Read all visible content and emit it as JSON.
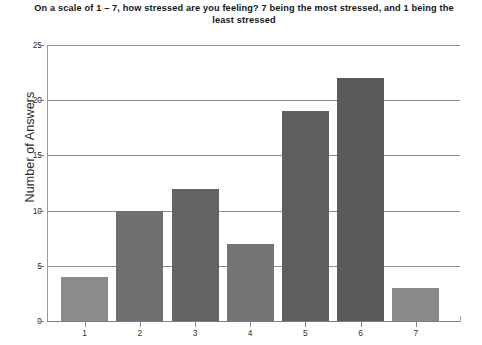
{
  "chart_data": {
    "type": "bar",
    "title": "On a scale of 1 – 7, how stressed are you feeling? 7 being the most stressed, and 1 being the least stressed",
    "xlabel": "",
    "ylabel": "Number of Answers",
    "categories": [
      "1",
      "2",
      "3",
      "4",
      "5",
      "6",
      "7"
    ],
    "values": [
      4,
      10,
      12,
      7,
      19,
      22,
      3
    ],
    "ylim": [
      0,
      25
    ],
    "ytick_labels": [
      "0",
      "5",
      "10",
      "15",
      "20",
      "25"
    ],
    "ytick_values": [
      0,
      5,
      10,
      15,
      20,
      25
    ],
    "grid": "horizontal",
    "legend": "none",
    "bar_colors": [
      "#8b8b8b",
      "#6f6f71",
      "#636365",
      "#757577",
      "#5f5f61",
      "#5a5a5c",
      "#8a8a8a"
    ],
    "background_color": "#ffffff",
    "gridline_color": "#8e8e8e",
    "axis_color": "#7d7d7d",
    "text_color": "#2f2f2f"
  }
}
